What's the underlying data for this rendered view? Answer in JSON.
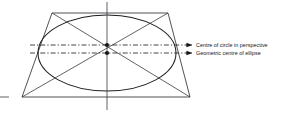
{
  "figure": {
    "labels": {
      "perspective_centre": "Centre of circle in perspective",
      "geometric_centre": "Geometric centre of ellipse"
    },
    "icons": {
      "arrow_perspective": "arrow-right-icon",
      "arrow_geometric": "arrow-right-icon"
    },
    "colors": {
      "ink": "#16161a",
      "line": "#2b2b2f",
      "background": "#ffffff"
    },
    "geometry": {
      "trapezoid": {
        "top_left": [
          52,
          13
        ],
        "top_right": [
          168,
          13
        ],
        "bottom_right": [
          190,
          97
        ],
        "bottom_left": [
          22,
          97
        ]
      },
      "ellipse": {
        "cx": 107,
        "cy": 53,
        "rx": 69,
        "ry": 38
      },
      "vertical_axis": {
        "x": 107,
        "y1": 2,
        "y2": 110
      },
      "centre_perspective": [
        107,
        45
      ],
      "centre_geometric": [
        107,
        53
      ],
      "leader_perspective": {
        "y": 45,
        "x1": 30,
        "x2": 192
      },
      "leader_geometric": {
        "y": 53,
        "x1": 30,
        "x2": 192
      },
      "left_tick": {
        "x1": 0,
        "x2": 9,
        "y": 97
      }
    }
  }
}
